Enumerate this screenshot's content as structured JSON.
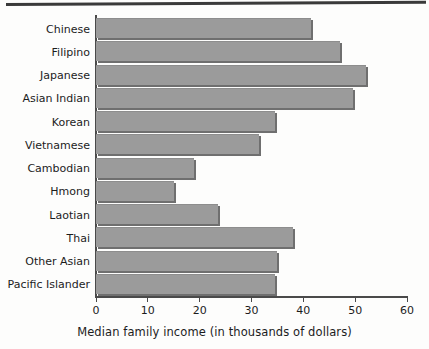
{
  "chart_data": {
    "type": "bar",
    "orientation": "horizontal",
    "title": "",
    "xlabel": "Median family income (in thousands of dollars)",
    "ylabel": "",
    "xlim": [
      0,
      60
    ],
    "xticks": [
      0,
      10,
      20,
      30,
      40,
      50,
      60
    ],
    "xtick_labels": [
      "0",
      "10",
      "20",
      "30",
      "40",
      "50",
      "60"
    ],
    "grid": false,
    "legend": null,
    "bar_color": "#9b9b9b",
    "bar_shadow_color": "#6f6f6f",
    "axis_color": "#4a4a4a",
    "background_color": "#fdfdfc",
    "categories": [
      "Chinese",
      "Filipino",
      "Japanese",
      "Asian Indian",
      "Korean",
      "Vietnamese",
      "Cambodian",
      "Hmong",
      "Laotian",
      "Thai",
      "Other Asian",
      "Pacific Islander"
    ],
    "values": [
      41.5,
      47,
      52,
      49.5,
      34.5,
      31.5,
      19,
      15,
      23.5,
      38,
      35,
      34.5
    ],
    "units": "thousands of dollars"
  }
}
